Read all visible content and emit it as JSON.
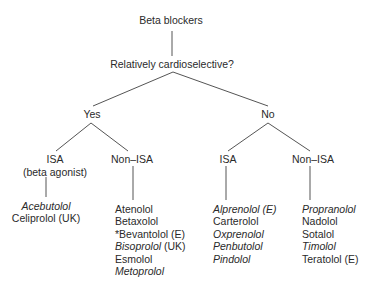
{
  "diagram": {
    "root": "Beta blockers",
    "question": "Relatively cardioselective?",
    "branches": {
      "yes": {
        "label": "Yes",
        "isa": {
          "label": "ISA",
          "sublabel": "(beta agonist)",
          "drugs": [
            {
              "name": "Acebutolol",
              "italic": true
            },
            {
              "name": "Celiprolol (UK)",
              "italic": false
            }
          ]
        },
        "non_isa": {
          "label": "Non–ISA",
          "drugs": [
            {
              "name": "Atenolol",
              "italic": false
            },
            {
              "name": "Betaxolol",
              "italic": false
            },
            {
              "name": "*Bevantolol (E)",
              "italic": false
            },
            {
              "name": "Bisoprolol",
              "suffix": " (UK)",
              "italic": true
            },
            {
              "name": "Esmolol",
              "italic": false
            },
            {
              "name": "Metoprolol",
              "italic": true
            }
          ]
        }
      },
      "no": {
        "label": "No",
        "isa": {
          "label": "ISA",
          "drugs": [
            {
              "name": "Alprenolol (E)",
              "italic": true
            },
            {
              "name": "Carterolol",
              "italic": false
            },
            {
              "name": "Oxprenolol",
              "italic": true
            },
            {
              "name": "Penbutolol",
              "italic": true
            },
            {
              "name": "Pindolol",
              "italic": true
            }
          ]
        },
        "non_isa": {
          "label": "Non–ISA",
          "drugs": [
            {
              "name": "Propranolol",
              "italic": true
            },
            {
              "name": "Nadolol",
              "italic": false
            },
            {
              "name": "Sotalol",
              "italic": false
            },
            {
              "name": "Timolol",
              "italic": true
            },
            {
              "name": "Teratolol (E)",
              "italic": false
            }
          ]
        }
      }
    }
  }
}
